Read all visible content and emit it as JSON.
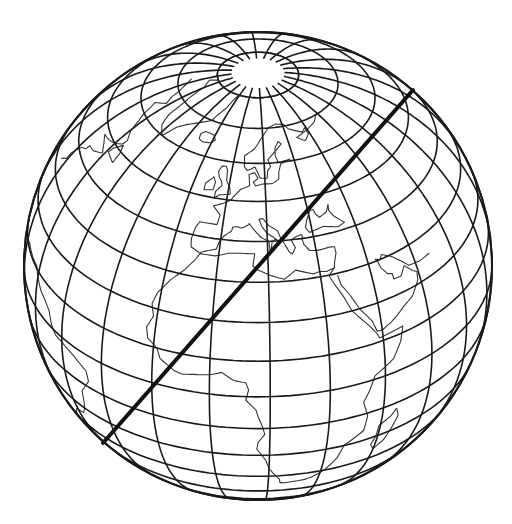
{
  "figure": {
    "type": "globe-orthographic",
    "colors": {
      "background": "#ffffff",
      "lines": "#1a1a1a",
      "coast": "#333333",
      "great_circle": "#111111"
    },
    "globe": {
      "cx": 258,
      "cy": 266,
      "r": 234,
      "center_lat": 34,
      "center_lon": 12
    },
    "graticule": {
      "lat_step_deg": 10,
      "lon_step_deg": 15,
      "polar_cap_lat": 80
    },
    "great_circle": {
      "x1": 413,
      "y1": 90,
      "x2": 103,
      "y2": 443
    },
    "regions_shown": [
      "Greenland",
      "Iceland",
      "Scandinavia",
      "British Isles",
      "Iberia",
      "Mediterranean",
      "Italy",
      "Arabian Peninsula",
      "Africa",
      "South America (east coast)"
    ]
  }
}
